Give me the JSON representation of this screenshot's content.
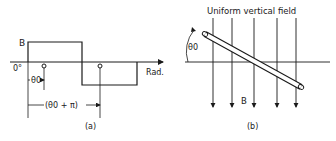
{
  "panel_a": {
    "caption": "(a)",
    "y_label": "B",
    "origin_label": "0°",
    "x_axis_label": "Rad.",
    "theta0_label": "θ0",
    "theta0_pi_label": "(θ0 + π)",
    "marker_symbol": "o"
  },
  "panel_b": {
    "caption": "(b)",
    "title": "Uniform vertical field",
    "field_label": "B",
    "angle_label": "θ0"
  },
  "colors": {
    "ink": "#1a1a1a",
    "background": "#ffffff"
  }
}
